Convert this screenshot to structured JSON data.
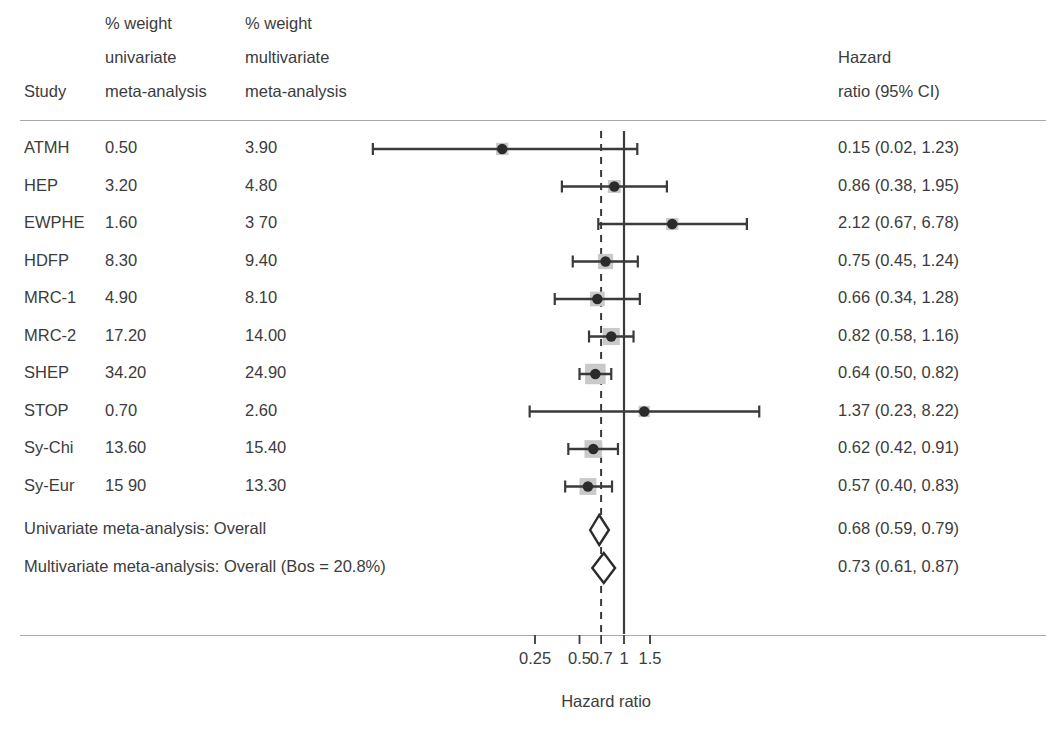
{
  "header": {
    "col_study": "Study",
    "col_w1_line1": "% weight",
    "col_w1_line2": "univariate",
    "col_w1_line3": "meta-analysis",
    "col_w2_line1": "% weight",
    "col_w2_line2": "multivariate",
    "col_w2_line3": "meta-analysis",
    "col_hr_line1": "Hazard",
    "col_hr_line2": "ratio (95% CI)"
  },
  "axis": {
    "title": "Hazard ratio",
    "ticks": [
      {
        "label": "0.25",
        "value": 0.25
      },
      {
        "label": "0.5",
        "value": 0.5
      },
      {
        "label": "0.7",
        "value": 0.7
      },
      {
        "label": "1",
        "value": 1
      },
      {
        "label": "1.5",
        "value": 1.5
      }
    ],
    "null_line": 1,
    "dashed_line": 0.7
  },
  "chart_data": {
    "type": "forest",
    "title": "",
    "xlabel": "Hazard ratio",
    "ylabel": "",
    "xscale": "log",
    "xlim": [
      0.2,
      2.0
    ],
    "grid": false,
    "legend": "none",
    "null_value": 1,
    "pooled_reference_line": 0.7,
    "columns": [
      "Study",
      "% weight univariate meta-analysis",
      "% weight multivariate meta-analysis",
      "Hazard ratio (95% CI)"
    ],
    "rows": [
      {
        "study": "ATMH",
        "w_uni": "0.50",
        "w_multi": "3.90",
        "hr_text": "0.15 (0.02, 1.23)",
        "hr": 0.15,
        "lo": 0.02,
        "hi": 1.23,
        "weight": 3.9,
        "arrow_left": true
      },
      {
        "study": "HEP",
        "w_uni": "3.20",
        "w_multi": "4.80",
        "hr_text": "0.86 (0.38, 1.95)",
        "hr": 0.86,
        "lo": 0.38,
        "hi": 1.95,
        "weight": 4.8,
        "arrow_left": false
      },
      {
        "study": "EWPHE",
        "w_uni": "1.60",
        "w_multi": "3 70",
        "hr_text": "2.12 (0.67, 6.78)",
        "hr": 2.12,
        "lo": 0.67,
        "hi": 6.78,
        "weight": 3.7,
        "arrow_left": false
      },
      {
        "study": "HDFP",
        "w_uni": "8.30",
        "w_multi": "9.40",
        "hr_text": "0.75 (0.45, 1.24)",
        "hr": 0.75,
        "lo": 0.45,
        "hi": 1.24,
        "weight": 9.4,
        "arrow_left": false
      },
      {
        "study": "MRC-1",
        "w_uni": "4.90",
        "w_multi": "8.10",
        "hr_text": "0.66 (0.34, 1.28)",
        "hr": 0.66,
        "lo": 0.34,
        "hi": 1.28,
        "weight": 8.1,
        "arrow_left": false
      },
      {
        "study": "MRC-2",
        "w_uni": "17.20",
        "w_multi": "14.00",
        "hr_text": "0.82 (0.58, 1.16)",
        "hr": 0.82,
        "lo": 0.58,
        "hi": 1.16,
        "weight": 14.0,
        "arrow_left": false
      },
      {
        "study": "SHEP",
        "w_uni": "34.20",
        "w_multi": "24.90",
        "hr_text": "0.64 (0.50, 0.82)",
        "hr": 0.64,
        "lo": 0.5,
        "hi": 0.82,
        "weight": 24.9,
        "arrow_left": false
      },
      {
        "study": "STOP",
        "w_uni": "0.70",
        "w_multi": "2.60",
        "hr_text": "1.37 (0.23, 8.22)",
        "hr": 1.37,
        "lo": 0.23,
        "hi": 8.22,
        "weight": 2.6,
        "arrow_left": false
      },
      {
        "study": "Sy-Chi",
        "w_uni": "13.60",
        "w_multi": "15.40",
        "hr_text": "0.62 (0.42, 0.91)",
        "hr": 0.62,
        "lo": 0.42,
        "hi": 0.91,
        "weight": 15.4,
        "arrow_left": false
      },
      {
        "study": "Sy-Eur",
        "w_uni": "15 90",
        "w_multi": "13.30",
        "hr_text": "0.57 (0.40, 0.83)",
        "hr": 0.57,
        "lo": 0.4,
        "hi": 0.83,
        "weight": 13.3,
        "arrow_left": false
      }
    ],
    "summaries": [
      {
        "label": "Univariate meta-analysis: Overall",
        "hr_text": "0.68 (0.59, 0.79)",
        "hr": 0.68,
        "lo": 0.59,
        "hi": 0.79
      },
      {
        "label": "Multivariate meta-analysis: Overall (Bos = 20.8%)",
        "hr_text": "0.73 (0.61, 0.87)",
        "hr": 0.73,
        "lo": 0.61,
        "hi": 0.87
      }
    ]
  },
  "colors": {
    "text": "#3c3c3c",
    "rule": "#a8a8a8",
    "line": "#3a3a3a",
    "marker": "#2b2b2b",
    "weight_box": "#c9c9c9"
  }
}
